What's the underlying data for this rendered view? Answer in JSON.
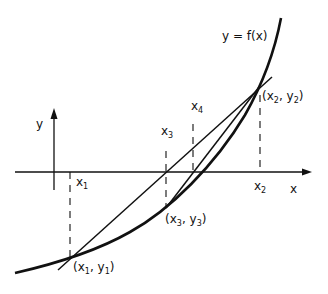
{
  "diagram": {
    "type": "secant-method-illustration",
    "curve_label": "y = f(x)",
    "axes": {
      "x_label": "x",
      "y_label": "y"
    },
    "x_ticks": [
      {
        "name": "x1",
        "base": "x",
        "sub": "1"
      },
      {
        "name": "x2",
        "base": "x",
        "sub": "2"
      },
      {
        "name": "x3",
        "base": "x",
        "sub": "3"
      },
      {
        "name": "x4",
        "base": "x",
        "sub": "4"
      }
    ],
    "points": [
      {
        "name": "p1",
        "label": "(x1, y1)",
        "open": "(x",
        "sub1": "1",
        "mid": ", y",
        "sub2": "1",
        "close": ")"
      },
      {
        "name": "p2",
        "label": "(x2, y2)",
        "open": "(x",
        "sub1": "2",
        "mid": ", y",
        "sub2": "2",
        "close": ")"
      },
      {
        "name": "p3",
        "label": "(x3, y3)",
        "open": "(x",
        "sub1": "3",
        "mid": ", y",
        "sub2": "3",
        "close": ")"
      }
    ],
    "colors": {
      "ink": "#111111",
      "background": "#ffffff"
    }
  }
}
